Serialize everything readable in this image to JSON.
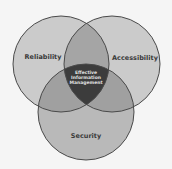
{
  "diagram": {
    "type": "venn",
    "sets": [
      {
        "id": "reliability",
        "label": "Reliability"
      },
      {
        "id": "accessibility",
        "label": "Accessibility"
      },
      {
        "id": "security",
        "label": "Security"
      }
    ],
    "center": {
      "lines": [
        "Effective",
        "Information",
        "Management"
      ]
    },
    "colors": {
      "background": "#f5f5f5",
      "circle_fill": "#c8c8c8",
      "pair_overlap": "#9a9a9a",
      "center_fill": "#3c3c3c",
      "stroke": "#4a4a4a",
      "label": "#3a3a3a",
      "center_label": "#e0e0e0"
    }
  }
}
